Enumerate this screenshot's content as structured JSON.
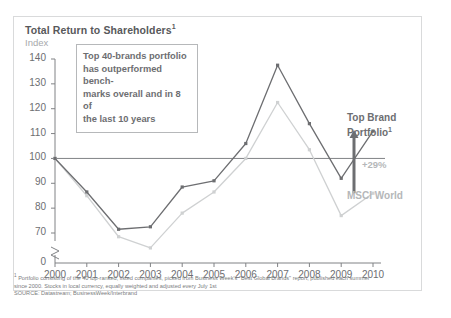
{
  "chart_data": {
    "type": "line",
    "title": "Total Return to Shareholders",
    "title_superscript": "1",
    "subtitle": "Index",
    "xlabel": "",
    "ylabel": "Index",
    "categories": [
      "2000",
      "2001",
      "2002",
      "2003",
      "2004",
      "2005",
      "2006",
      "2007",
      "2008",
      "2009",
      "2010"
    ],
    "x": [
      2000,
      2001,
      2002,
      2003,
      2004,
      2005,
      2006,
      2007,
      2008,
      2009,
      2010
    ],
    "ylim": [
      70,
      140
    ],
    "yticks": [
      "140",
      "130",
      "120",
      "110",
      "100",
      "90",
      "80",
      "70",
      "0"
    ],
    "ytick_values": [
      140,
      130,
      120,
      110,
      100,
      90,
      80,
      70,
      0
    ],
    "axis_break": true,
    "grid": false,
    "reference_line": 100,
    "legend_position": "right-inline",
    "series": [
      {
        "name": "Top Brand Portfolio",
        "name_superscript": "1",
        "color": "#6d6e71",
        "values": [
          100,
          86.5,
          71.5,
          72.5,
          88.5,
          91,
          106,
          137.5,
          114,
          92,
          111
        ]
      },
      {
        "name": "MSCI World",
        "color": "#cfd1d2",
        "values": [
          100,
          85,
          68.5,
          64,
          78,
          86.5,
          100,
          122.5,
          103.5,
          77,
          86
        ]
      }
    ],
    "annotations": [
      {
        "name": "callout-box",
        "text": "Top 40-brands portfolio has outperformed bench-marks overall and in 8 of the last 10 years"
      },
      {
        "name": "delta-arrow",
        "text": "+29%"
      }
    ]
  },
  "callout": {
    "line1": "Top 40-brands portfolio",
    "line2": "has outperformed bench-",
    "line3": "marks overall and in 8 of",
    "line4": "the last 10 years"
  },
  "labels": {
    "top_brand_line1": "Top Brand",
    "top_brand_line2": "Portfolio",
    "top_brand_superscript": "1",
    "msci": "MSCI World",
    "delta": "+29%"
  },
  "footnotes": {
    "note1_marker": "1",
    "note1_line1": "Portfolio consisting of the 40 top-ranked, listed companies, picked from Business Week's \"Best Global Brands\" report, published each summer",
    "note1_line2": "since 2000. Stocks in local currency, equally weighted and adjusted every July 1st",
    "source": "SOURCE: Datastream; BusinessWeek/Interbrand"
  },
  "colors": {
    "series_dark": "#6d6e71",
    "series_light": "#cfd1d2",
    "reference_line": "#808285",
    "card_border": "#d9dadb",
    "text": "#58595b",
    "muted_text": "#a7a9ac"
  }
}
